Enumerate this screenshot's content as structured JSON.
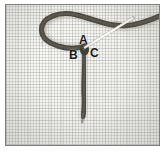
{
  "image": {
    "kind": "photograph",
    "subject": "embroidery-stitch-demonstration",
    "width": 167,
    "height": 153,
    "border_color": "#7d7f7c",
    "background_color": "#ffffff"
  },
  "fabric": {
    "name": "woven-cloth-background",
    "base_color": "#f4f3ef",
    "weave_color": "#96988f"
  },
  "thread": {
    "name": "embroidery-thread",
    "color": "#4a463f",
    "shadow_color": "#8e8a82",
    "segments": [
      {
        "id": "loop",
        "description": "open teardrop loop at upper left"
      },
      {
        "id": "tail-right",
        "description": "thread running right off the edge of frame"
      },
      {
        "id": "stem-down",
        "description": "vertical thread descending from junction"
      }
    ]
  },
  "needle": {
    "name": "sewing-needle",
    "color": "#f7f6f2",
    "outline_color": "#6e6c66",
    "from": {
      "x": 85,
      "y": 47
    },
    "to": {
      "x": 133,
      "y": 18
    }
  },
  "labels": [
    {
      "id": "a",
      "text": "A",
      "x": 78,
      "y": 33
    },
    {
      "id": "b",
      "text": "B",
      "x": 68,
      "y": 48
    },
    {
      "id": "c",
      "text": "C",
      "x": 89,
      "y": 46
    }
  ]
}
